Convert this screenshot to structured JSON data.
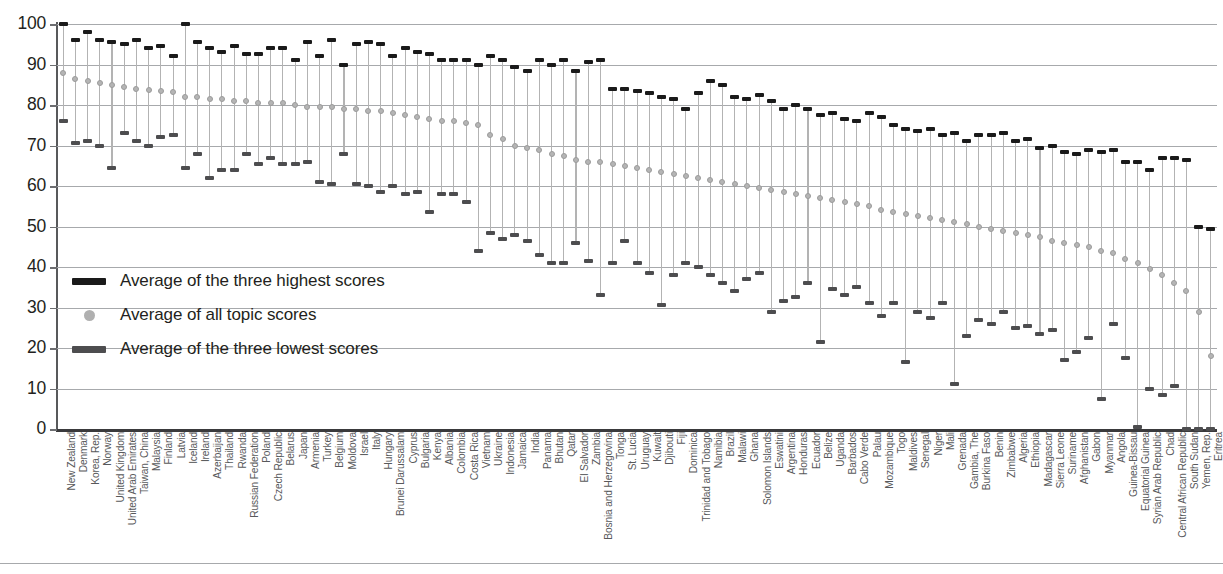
{
  "chart_data": {
    "type": "bar",
    "title": "",
    "subtitle": "",
    "xlabel": "",
    "ylabel": "",
    "ylim": [
      0,
      100
    ],
    "yticks": [
      0,
      10,
      20,
      30,
      40,
      50,
      60,
      70,
      80,
      90,
      100
    ],
    "grid": true,
    "legend_position": "inside-left",
    "legend": [
      {
        "key": "high",
        "label": "Average of the three highest scores",
        "marker": "bar",
        "color": "#1a1a1a"
      },
      {
        "key": "mean",
        "label": "Average of all topic scores",
        "marker": "dot",
        "color": "#b0b0b0"
      },
      {
        "key": "low",
        "label": "Average of the three lowest scores",
        "marker": "bar",
        "color": "#4d4d4f"
      }
    ],
    "series": [
      {
        "name": "Average of the three highest scores",
        "key": "high"
      },
      {
        "name": "Average of all topic scores",
        "key": "mean"
      },
      {
        "name": "Average of the three lowest scores",
        "key": "low"
      }
    ],
    "categories": [
      "New Zealand",
      "Denmark",
      "Korea, Rep.",
      "Norway",
      "United Kingdom",
      "United Arab Emirates",
      "Taiwan, China",
      "Malaysia",
      "Finland",
      "Latvia",
      "Iceland",
      "Ireland",
      "Azerbaijan",
      "Thailand",
      "Rwanda",
      "Russian Federation",
      "Poland",
      "Czech Republic",
      "Belarus",
      "Japan",
      "Armenia",
      "Turkey",
      "Belgium",
      "Moldova",
      "Israel",
      "Italy",
      "Hungary",
      "Brunei Darussalam",
      "Cyprus",
      "Bulgaria",
      "Kenya",
      "Albania",
      "Colombia",
      "Costa Rica",
      "Vietnam",
      "Ukraine",
      "Indonesia",
      "Jamaica",
      "India",
      "Panama",
      "Bhutan",
      "Qatar",
      "El Salvador",
      "Zambia",
      "Bosnia and Herzegovina",
      "Tonga",
      "St. Lucia",
      "Uruguay",
      "Kuwait",
      "Djibouti",
      "Fiji",
      "Dominica",
      "Trinidad and Tobago",
      "Namibia",
      "Brazil",
      "Malawi",
      "Ghana",
      "Solomon Islands",
      "Eswatini",
      "Argentina",
      "Honduras",
      "Ecuador",
      "Belize",
      "Uganda",
      "Barbados",
      "Cabo Verde",
      "Palau",
      "Mozambique",
      "Togo",
      "Maldives",
      "Senegal",
      "Niger",
      "Mali",
      "Grenada",
      "Gambia, The",
      "Burkina Faso",
      "Benin",
      "Zimbabwe",
      "Algeria",
      "Ethiopia",
      "Madagascar",
      "Sierra Leone",
      "Suriname",
      "Afghanistan",
      "Gabon",
      "Myanmar",
      "Angola",
      "Guinea-Bissau",
      "Equatorial Guinea",
      "Syrian Arab Republic",
      "Chad",
      "Central African Republic",
      "South Sudan",
      "Yemen, Rep.",
      "Eritrea"
    ],
    "values_high": [
      100,
      96,
      98,
      96,
      95.5,
      95,
      96,
      94,
      94.5,
      92,
      100,
      95.5,
      94,
      93,
      94.5,
      92.5,
      92.5,
      94,
      94,
      91,
      95.5,
      92,
      96,
      90,
      95,
      95.5,
      95,
      92,
      94,
      93,
      92.5,
      91,
      91,
      91,
      90,
      92,
      91,
      89.5,
      88.5,
      91,
      90,
      91,
      88.5,
      90.5,
      91,
      84,
      84,
      83.5,
      83,
      82,
      81.5,
      79,
      83,
      86,
      85,
      82,
      81.5,
      82.5,
      81,
      79,
      80,
      79,
      77.5,
      78,
      76.5,
      76,
      78,
      77,
      75,
      74,
      73.5,
      74,
      72.5,
      73,
      71,
      72.5,
      72.5,
      73,
      71,
      71.5,
      69.5,
      70,
      68.5,
      68,
      69,
      68.5,
      69,
      66,
      66,
      64,
      67,
      67,
      66.5,
      50,
      49.5
    ],
    "values_mean": [
      88,
      86.5,
      86,
      85.5,
      85,
      84.5,
      84,
      83.8,
      83.5,
      83.2,
      82,
      82,
      81.5,
      81.5,
      81,
      81,
      80.5,
      80.5,
      80.5,
      80,
      79.5,
      79.5,
      79.5,
      79,
      79,
      78.5,
      78.5,
      78,
      77.5,
      77,
      76.5,
      76,
      76,
      75.5,
      75,
      72.5,
      71.5,
      70,
      69.5,
      69,
      68,
      67.5,
      66.5,
      66,
      66,
      65.5,
      65,
      64.5,
      64,
      63.5,
      63,
      62.5,
      62,
      61.5,
      61,
      60.5,
      60,
      59.5,
      59,
      58.5,
      58,
      57.5,
      57,
      56.5,
      56,
      55.5,
      55,
      54,
      53.5,
      53,
      52.5,
      52,
      51.5,
      51,
      50.5,
      50,
      49.5,
      49,
      48.5,
      48,
      47.5,
      46.5,
      46,
      45.5,
      45,
      44,
      43.5,
      42,
      41,
      39.5,
      38,
      36,
      34,
      29,
      18
    ],
    "values_low": [
      76,
      70.5,
      71,
      70,
      64.5,
      73,
      71,
      70,
      72,
      72.5,
      64.5,
      68,
      62,
      64,
      64,
      68,
      65.5,
      67,
      65.5,
      65.5,
      66,
      61,
      60.5,
      68,
      60.5,
      60,
      58.5,
      60,
      58,
      58.5,
      53.5,
      58,
      58,
      56,
      44,
      48.5,
      47,
      48,
      46.5,
      43,
      41,
      41,
      46,
      41.5,
      33,
      41,
      46.5,
      41,
      38.5,
      30.5,
      38,
      41,
      40,
      38,
      36,
      34,
      37,
      38.5,
      29,
      31.5,
      32.5,
      36,
      21.5,
      34.5,
      33,
      35,
      31,
      28,
      31,
      16.5,
      29,
      27.5,
      31,
      11,
      23,
      27,
      26,
      29,
      25,
      25.5,
      23.5,
      24.5,
      17,
      19,
      22.5,
      7.5,
      26,
      17.5,
      0.5,
      10,
      8.5,
      10.5,
      0,
      0,
      0
    ]
  }
}
